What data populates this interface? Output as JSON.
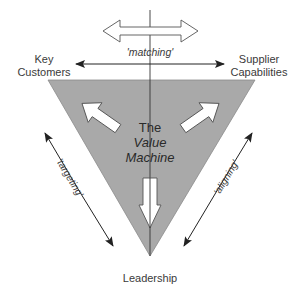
{
  "diagram": {
    "title_lines": [
      "The",
      "Value",
      "Machine"
    ],
    "nodes": {
      "top_left": [
        "Key",
        "Customers"
      ],
      "top_right": [
        "Supplier",
        "Capabilities"
      ],
      "bottom": "Leadership"
    },
    "relations": {
      "top": "'matching'",
      "left": "'targeting'",
      "right": "'aligning'"
    },
    "colors": {
      "triangle_fill": "#a9a9a9",
      "line": "#333333",
      "arrow_fill": "#ffffff",
      "text": "#3a3a3a"
    }
  }
}
